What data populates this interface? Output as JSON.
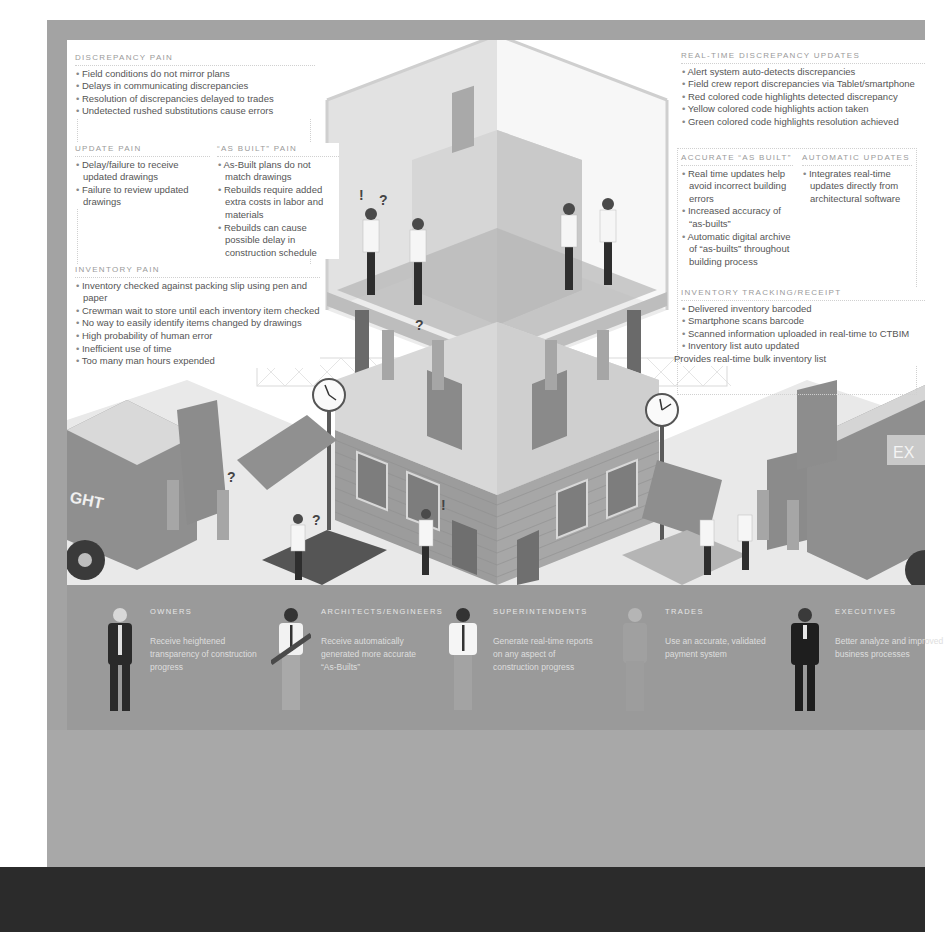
{
  "colors": {
    "frame": "#a3a3a3",
    "poster_bg": "#ffffff",
    "band": "#9a9a9a",
    "lower_panel": "#a8a8a8",
    "bottom_bar": "#2b2b2b",
    "heading_text": "#9a9a9a",
    "body_text": "#555555"
  },
  "left_panels": {
    "discrepancy_pain": {
      "title": "Discrepancy Pain",
      "items": [
        "Field conditions do not mirror plans",
        "Delays in communicating discrepancies",
        "Resolution of discrepancies delayed to trades",
        "Undetected rushed substitutions cause errors"
      ]
    },
    "update_pain": {
      "title": "Update Pain",
      "items": [
        "Delay/failure to receive updated drawings",
        "Failure to review updated drawings"
      ]
    },
    "as_built_pain": {
      "title": "“As Built” Pain",
      "items": [
        "As-Built plans do not match drawings",
        "Rebuilds require added extra costs in labor and materials",
        "Rebuilds can cause possible delay in construction schedule"
      ]
    },
    "inventory_pain": {
      "title": "Inventory Pain",
      "items": [
        "Inventory checked against packing slip using pen and paper",
        "Crewman wait to store until each inventory item checked",
        "No way to easily identify items changed by drawings",
        "High probability of human error",
        "Inefficient use of time",
        "Too many man hours expended"
      ]
    }
  },
  "right_panels": {
    "real_time_updates": {
      "title": "Real-Time Discrepancy Updates",
      "items": [
        "Alert system auto-detects discrepancies",
        "Field crew report discrepancies via Tablet/smartphone",
        "Red colored code highlights detected discrepancy",
        "Yellow colored code highlights action taken",
        "Green colored code highlights resolution achieved"
      ]
    },
    "accurate_as_built": {
      "title": "Accurate “As Built”",
      "items": [
        "Real time updates help avoid incorrect building errors",
        "Increased accuracy of “as-builts”",
        "Automatic digital archive of “as-builts” throughout building process"
      ]
    },
    "automatic_updates": {
      "title": "Automatic Updates",
      "items": [
        "Integrates real-time updates directly from architectural software"
      ]
    },
    "inventory_tracking": {
      "title": "Inventory Tracking/Receipt",
      "items": [
        "Delivered inventory barcoded",
        "Smartphone scans barcode",
        "Scanned information uploaded in real-time to CTBIM",
        "Inventory list auto updated"
      ],
      "footer": "Provides real-time bulk inventory list"
    }
  },
  "illustration": {
    "left_truck_label": "GHT",
    "right_truck_label": "EX",
    "question_mark": "?",
    "exclamation_mark": "!"
  },
  "roles": [
    {
      "name": "Owners",
      "description": "Receive heightened transparency of construction progress",
      "icon": "owner-figure-icon"
    },
    {
      "name": "Architects/Engineers",
      "description": "Receive automatically generated more accurate “As-Builts”",
      "icon": "architect-figure-icon"
    },
    {
      "name": "Superintendents",
      "description": "Generate real-time reports on any aspect of construction progress",
      "icon": "superintendent-figure-icon"
    },
    {
      "name": "Trades",
      "description": "Use an accurate, validated payment system",
      "icon": "trades-figure-icon"
    },
    {
      "name": "Executives",
      "description": "Better analyze and improved business processes",
      "icon": "executive-figure-icon"
    }
  ]
}
